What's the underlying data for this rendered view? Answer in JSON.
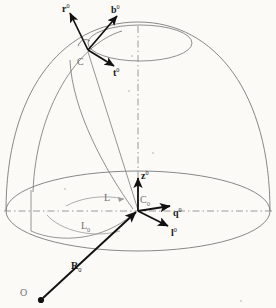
{
  "figure": {
    "kind": "geometry-diagram",
    "background_color": "#fbfaf7",
    "line_color": "#7b7b7b",
    "vector_color": "#111111",
    "axis_color": "#8e8e8e"
  },
  "labels": {
    "r_vector": {
      "base": "r",
      "sup": "0",
      "x": 62,
      "y": 4
    },
    "b_vector": {
      "base": "b",
      "sup": "0",
      "x": 111,
      "y": 5
    },
    "t_vector": {
      "base": "t",
      "sup": "0",
      "x": 112,
      "y": 68
    },
    "point_c": {
      "base": "C",
      "x": 77,
      "y": 58
    },
    "z_vector": {
      "base": "z",
      "sup": "0",
      "x": 141,
      "y": 171
    },
    "point_c0": {
      "base": "C",
      "sub": "0",
      "x": 140,
      "y": 196
    },
    "q_vector": {
      "base": "q",
      "sup": "0",
      "x": 173,
      "y": 208
    },
    "l_vector": {
      "base": "l",
      "sup": "0",
      "x": 170,
      "y": 228
    },
    "angle_l": {
      "base": "L",
      "x": 104,
      "y": 194
    },
    "angle_l0": {
      "base": "L",
      "sub": "0",
      "x": 81,
      "y": 222
    },
    "radius_r0": {
      "base": "R",
      "sub": "0",
      "x": 71,
      "y": 262
    },
    "origin_o": {
      "base": "O",
      "x": 20,
      "y": 289
    }
  },
  "geometry": {
    "dome_apex": {
      "x": 138,
      "y": 28
    },
    "center_c0": {
      "x": 138,
      "y": 211
    },
    "surface_point_c": {
      "x": 88,
      "y": 50
    },
    "origin_o": {
      "x": 40,
      "y": 300
    },
    "base_ellipse": {
      "cx": 138,
      "cy": 211,
      "rx": 132,
      "ry": 40
    },
    "upper_ellipse": {
      "cx": 140,
      "cy": 43,
      "rx": 52,
      "ry": 18
    }
  }
}
